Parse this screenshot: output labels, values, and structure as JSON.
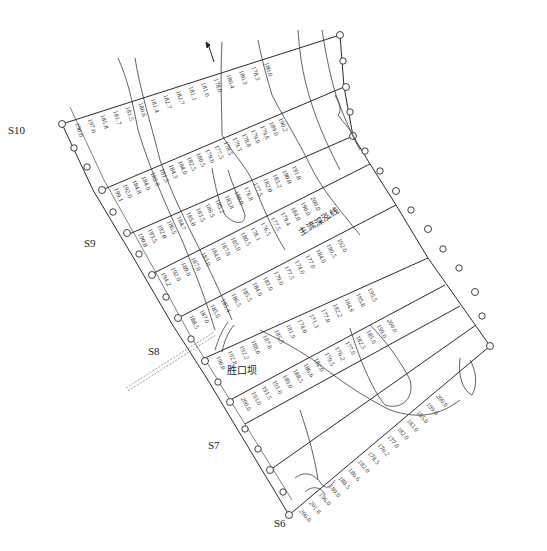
{
  "colors": {
    "line": "#2a2a2a",
    "contour": "#3a3a3a",
    "text": "#222222",
    "background": "#ffffff"
  },
  "section_labels": [
    {
      "id": "S10",
      "x": 8,
      "y": 130
    },
    {
      "id": "S9",
      "x": 84,
      "y": 243
    },
    {
      "id": "S8",
      "x": 148,
      "y": 351
    },
    {
      "id": "S7",
      "x": 208,
      "y": 445
    },
    {
      "id": "S6",
      "x": 274,
      "y": 523
    }
  ],
  "annotations": {
    "weir_label": "胜口坝",
    "channel_label": "主流深泓线",
    "north_arrow": "north-arrow"
  },
  "contour_labels": [
    "180",
    "185",
    "190",
    "195",
    "200"
  ],
  "elevation_columns": [
    {
      "section": "S10",
      "values": [
        "180.0",
        "178.3",
        "180.3",
        "180.4",
        "178.0",
        "181.0",
        "181.1",
        "182.7",
        "182.7",
        "181.4",
        "180.6",
        "181.5",
        "181.7",
        "185.8",
        "197.0",
        "190.0"
      ]
    },
    {
      "section": "S9.5",
      "values": [
        "190.2",
        "189.0",
        "179.6",
        "179.0",
        "178.8",
        "179.3",
        "178.5",
        "177.5",
        "179.0",
        "180.5",
        "182.5",
        "184.0",
        "184.3",
        "181.5",
        "182.8",
        "184.0",
        "184.8",
        "192.0",
        "199.1"
      ]
    },
    {
      "section": "S9",
      "values": [
        "191.0",
        "190.0",
        "183.2",
        "182.0",
        "177.5",
        "176.8",
        "180.0",
        "183.8",
        "185.2",
        "186.5",
        "183.5",
        "185.0",
        "184.7",
        "186.5",
        "192.0",
        "193.5",
        "190.0"
      ]
    },
    {
      "section": "S8.5",
      "values": [
        "200.0",
        "190.0",
        "184.0",
        "179.4",
        "177.5",
        "176.5",
        "178.1",
        "180.5",
        "185.0",
        "187.0",
        "184.0",
        "183.0",
        "187.0",
        "189.0",
        "192.0",
        "194.2"
      ]
    },
    {
      "section": "S8",
      "values": [
        "192.0",
        "190.5",
        "184.0",
        "177.0",
        "174.0",
        "177.5",
        "179.0",
        "181.0",
        "184.0",
        "185.5",
        "186.5",
        "185.4",
        "185.0",
        "187.0",
        "188.5"
      ]
    },
    {
      "section": "S7.5",
      "values": [
        "195.5",
        "195.0",
        "184.6",
        "182.2",
        "177.0",
        "171.3",
        "174.0",
        "181.9",
        "185.5",
        "187.0",
        "188.0",
        "192.2",
        "192.8",
        "190.0"
      ]
    },
    {
      "section": "S7",
      "values": [
        "200.0",
        "199.0",
        "185.0",
        "182.5",
        "177.0",
        "176.2",
        "179.5",
        "182.0",
        "186.6",
        "188.5",
        "189.0",
        "191.0",
        "191.5",
        "193.0",
        "200.0"
      ]
    },
    {
      "section": "S6",
      "values": [
        "200.0",
        "199.0",
        "185.0",
        "183.0",
        "182.0",
        "177.0",
        "176.2",
        "178.5",
        "182.0",
        "186.6",
        "188.5",
        "189.0",
        "196.0",
        "201.8",
        "206.0"
      ]
    }
  ]
}
